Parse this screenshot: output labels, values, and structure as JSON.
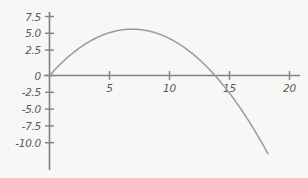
{
  "figure": {
    "background_color": "#f7f7f5",
    "axis_color": "#808080",
    "curve_color": "#9a9a9a",
    "label_color": "#5a5a5a",
    "width": 308,
    "height": 178
  },
  "chart_data": {
    "type": "line",
    "title": "",
    "xlabel": "",
    "ylabel": "",
    "xlim": [
      -1.0,
      21.5
    ],
    "ylim": [
      -11.6,
      8.7
    ],
    "grid": false,
    "legend": null,
    "x_ticks": [
      5,
      10,
      15,
      20
    ],
    "x_tick_labels": [
      "5",
      "10",
      "15",
      "20"
    ],
    "y_ticks": [
      7.5,
      5.0,
      2.5,
      0,
      -2.5,
      -5.0,
      -7.5,
      -10.0
    ],
    "y_tick_labels": [
      "7.5",
      "5.0",
      "2.5",
      "0",
      "-2.5",
      "-5.0",
      "-7.5",
      "-10.0"
    ],
    "axis_origin_crosses_zero": true,
    "series": [
      {
        "name": "parabola",
        "equation": "y = 2x - 0.145x^2",
        "vertex": [
          6.9,
          6.9
        ],
        "x_intercepts": [
          0,
          13.8
        ],
        "x": [
          0,
          0.5,
          1,
          1.5,
          2,
          2.5,
          3,
          3.5,
          4,
          4.5,
          5,
          5.5,
          6,
          6.5,
          7,
          7.5,
          8,
          8.5,
          9,
          9.5,
          10,
          10.5,
          11,
          11.5,
          12,
          12.5,
          13,
          13.5,
          14,
          14.5,
          15,
          15.5,
          16,
          16.5,
          17,
          17.5,
          18,
          18.2
        ],
        "y": [
          0,
          0.96,
          1.86,
          2.67,
          3.42,
          4.09,
          4.69,
          5.22,
          5.68,
          6.06,
          6.38,
          6.62,
          6.78,
          6.88,
          6.9,
          6.84,
          6.72,
          6.53,
          6.26,
          5.92,
          5.5,
          5.01,
          4.45,
          3.82,
          3.12,
          2.34,
          1.5,
          0.58,
          -0.42,
          -1.49,
          -393,
          0,
          0,
          0,
          0,
          0,
          0,
          0
        ]
      }
    ]
  }
}
